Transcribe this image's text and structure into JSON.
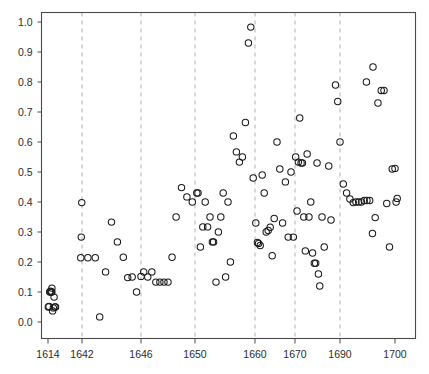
{
  "chart_data": {
    "type": "scatter",
    "title": "",
    "subtitle": "",
    "xlabel": "",
    "ylabel": "",
    "xlim": [
      1612,
      1702
    ],
    "ylim": [
      0.0,
      1.04
    ],
    "grid": true,
    "grid_axis": "x",
    "legend": null,
    "legend_position": "none",
    "marker": "open-circle",
    "marker_color": "#1a1a1a",
    "marker_size": 4,
    "xticks": [
      1614,
      1642,
      1646,
      1650,
      1660,
      1670,
      1690,
      1700
    ],
    "xticklabels": [
      "1614",
      "1642",
      "1646",
      "1650",
      "1660",
      "1670",
      "1690",
      "1700"
    ],
    "yticks": [
      0.0,
      0.1,
      0.2,
      0.3,
      0.4,
      0.5,
      0.6,
      0.7,
      0.8,
      0.9,
      1.0
    ],
    "yticklabels": [
      "0.0",
      "0.1",
      "0.2",
      "0.3",
      "0.4",
      "0.5",
      "0.6",
      "0.7",
      "0.8",
      "0.9",
      "1.0"
    ],
    "gridlines_x": [
      1642,
      1646,
      1650,
      1660,
      1670,
      1690
    ],
    "series": [
      {
        "name": "observations",
        "points": [
          [
            1614.3,
            0.05
          ],
          [
            1614.9,
            0.052
          ],
          [
            1615.4,
            0.1
          ],
          [
            1616.0,
            0.103
          ],
          [
            1616.6,
            0.1
          ],
          [
            1617.2,
            0.113
          ],
          [
            1617.2,
            0.1
          ],
          [
            1617.8,
            0.037
          ],
          [
            1618.4,
            0.047
          ],
          [
            1619.0,
            0.083
          ],
          [
            1619.6,
            0.05
          ],
          [
            1620.2,
            0.05
          ],
          [
            1641.0,
            0.214
          ],
          [
            1641.4,
            0.283
          ],
          [
            1641.8,
            0.398
          ],
          [
            1642.4,
            0.214
          ],
          [
            1642.9,
            0.214
          ],
          [
            1643.2,
            0.017
          ],
          [
            1643.6,
            0.167
          ],
          [
            1644.0,
            0.333
          ],
          [
            1644.4,
            0.267
          ],
          [
            1644.8,
            0.216
          ],
          [
            1645.1,
            0.148
          ],
          [
            1645.4,
            0.15
          ],
          [
            1645.7,
            0.1
          ],
          [
            1646.0,
            0.152
          ],
          [
            1646.2,
            0.167
          ],
          [
            1646.5,
            0.15
          ],
          [
            1646.8,
            0.167
          ],
          [
            1647.1,
            0.133
          ],
          [
            1647.4,
            0.133
          ],
          [
            1647.7,
            0.133
          ],
          [
            1648.0,
            0.133
          ],
          [
            1648.3,
            0.216
          ],
          [
            1648.6,
            0.35
          ],
          [
            1649.0,
            0.448
          ],
          [
            1649.4,
            0.417
          ],
          [
            1649.8,
            0.4
          ],
          [
            1650.3,
            0.43
          ],
          [
            1650.5,
            0.43
          ],
          [
            1650.9,
            0.25
          ],
          [
            1651.3,
            0.317
          ],
          [
            1651.7,
            0.4
          ],
          [
            1652.1,
            0.317
          ],
          [
            1652.5,
            0.35
          ],
          [
            1652.9,
            0.267
          ],
          [
            1653.1,
            0.267
          ],
          [
            1653.5,
            0.133
          ],
          [
            1653.9,
            0.3
          ],
          [
            1654.3,
            0.35
          ],
          [
            1654.7,
            0.43
          ],
          [
            1655.1,
            0.15
          ],
          [
            1655.5,
            0.4
          ],
          [
            1655.9,
            0.2
          ],
          [
            1656.4,
            0.62
          ],
          [
            1656.9,
            0.567
          ],
          [
            1657.4,
            0.533
          ],
          [
            1657.9,
            0.55
          ],
          [
            1658.4,
            0.665
          ],
          [
            1658.9,
            0.93
          ],
          [
            1659.3,
            0.983
          ],
          [
            1659.7,
            0.48
          ],
          [
            1660.2,
            0.33
          ],
          [
            1660.6,
            0.265
          ],
          [
            1660.9,
            0.262
          ],
          [
            1661.3,
            0.255
          ],
          [
            1661.8,
            0.49
          ],
          [
            1662.3,
            0.43
          ],
          [
            1662.8,
            0.3
          ],
          [
            1663.3,
            0.305
          ],
          [
            1663.8,
            0.316
          ],
          [
            1664.3,
            0.221
          ],
          [
            1664.8,
            0.345
          ],
          [
            1665.5,
            0.6
          ],
          [
            1666.2,
            0.51
          ],
          [
            1666.9,
            0.33
          ],
          [
            1667.6,
            0.467
          ],
          [
            1668.3,
            0.283
          ],
          [
            1669.0,
            0.5
          ],
          [
            1669.6,
            0.283
          ],
          [
            1670.3,
            0.55
          ],
          [
            1670.9,
            0.37
          ],
          [
            1671.5,
            0.533
          ],
          [
            1672.1,
            0.68
          ],
          [
            1672.7,
            0.53
          ],
          [
            1673.3,
            0.53
          ],
          [
            1673.9,
            0.35
          ],
          [
            1674.6,
            0.237
          ],
          [
            1675.4,
            0.56
          ],
          [
            1676.2,
            0.35
          ],
          [
            1677.0,
            0.4
          ],
          [
            1677.8,
            0.23
          ],
          [
            1678.6,
            0.196
          ],
          [
            1679.2,
            0.196
          ],
          [
            1679.8,
            0.53
          ],
          [
            1680.4,
            0.16
          ],
          [
            1681.0,
            0.12
          ],
          [
            1682.0,
            0.35
          ],
          [
            1683.0,
            0.25
          ],
          [
            1685.0,
            0.52
          ],
          [
            1686.0,
            0.34
          ],
          [
            1688.0,
            0.79
          ],
          [
            1689.0,
            0.735
          ],
          [
            1690.0,
            0.6
          ],
          [
            1690.6,
            0.46
          ],
          [
            1691.2,
            0.43
          ],
          [
            1691.8,
            0.41
          ],
          [
            1692.4,
            0.398
          ],
          [
            1692.9,
            0.4
          ],
          [
            1693.4,
            0.4
          ],
          [
            1693.9,
            0.4
          ],
          [
            1694.4,
            0.405
          ],
          [
            1694.9,
            0.405
          ],
          [
            1695.4,
            0.405
          ],
          [
            1695.9,
            0.295
          ],
          [
            1696.4,
            0.348
          ],
          [
            1696.9,
            0.73
          ],
          [
            1697.5,
            0.772
          ],
          [
            1698.0,
            0.772
          ],
          [
            1698.5,
            0.395
          ],
          [
            1699.0,
            0.25
          ],
          [
            1699.5,
            0.51
          ],
          [
            1700.0,
            0.512
          ],
          [
            1700.2,
            0.4
          ],
          [
            1700.4,
            0.412
          ],
          [
            1696.0,
            0.85
          ],
          [
            1694.8,
            0.8
          ]
        ]
      }
    ]
  },
  "axes": {
    "frame_color": "#4a4a4a",
    "grid_color": "#b0b0b0",
    "text_color": "#2b2b2b",
    "background": "#ffffff"
  }
}
